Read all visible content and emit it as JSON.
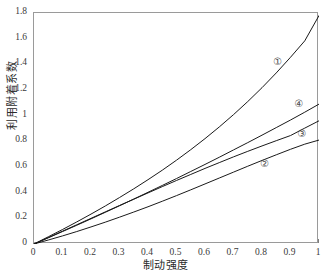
{
  "chart_data": {
    "type": "line",
    "title": "",
    "xlabel": "制动强度",
    "ylabel": "利用附着系数",
    "xlim": [
      0,
      1
    ],
    "ylim": [
      0,
      1.8
    ],
    "grid": false,
    "legend_position": "inline-annotations",
    "xticks": [
      "0",
      "0.1",
      "0.2",
      "0.3",
      "0.4",
      "0.5",
      "0.6",
      "0.7",
      "0.8",
      "0.9",
      "1"
    ],
    "xtick_values": [
      0,
      0.1,
      0.2,
      0.3,
      0.4,
      0.5,
      0.6,
      0.7,
      0.8,
      0.9,
      1
    ],
    "yticks": [
      "0",
      "0.2",
      "0.4",
      "0.6",
      "0.8",
      "1",
      "1.2",
      "1.4",
      "1.6",
      "1.8"
    ],
    "ytick_values": [
      0,
      0.2,
      0.4,
      0.6,
      0.8,
      1.0,
      1.2,
      1.4,
      1.6,
      1.8
    ],
    "x": [
      0,
      0.05,
      0.1,
      0.15,
      0.2,
      0.25,
      0.3,
      0.35,
      0.4,
      0.45,
      0.5,
      0.55,
      0.6,
      0.65,
      0.7,
      0.75,
      0.8,
      0.85,
      0.9,
      0.95,
      1.0
    ],
    "series": [
      {
        "name": "①",
        "color": "#1a1a1a",
        "values": [
          0,
          0.056,
          0.113,
          0.172,
          0.233,
          0.296,
          0.362,
          0.43,
          0.501,
          0.575,
          0.653,
          0.735,
          0.821,
          0.912,
          1.008,
          1.11,
          1.218,
          1.333,
          1.455,
          1.583,
          1.78
        ]
      },
      {
        "name": "②",
        "color": "#1a1a1a",
        "values": [
          0,
          0.031,
          0.063,
          0.097,
          0.133,
          0.17,
          0.209,
          0.249,
          0.29,
          0.333,
          0.377,
          0.422,
          0.468,
          0.514,
          0.56,
          0.606,
          0.651,
          0.695,
          0.738,
          0.778,
          0.81
        ]
      },
      {
        "name": "③",
        "color": "#1a1a1a",
        "values": [
          0,
          0.05,
          0.1,
          0.15,
          0.2,
          0.25,
          0.3,
          0.349,
          0.398,
          0.447,
          0.495,
          0.542,
          0.589,
          0.634,
          0.679,
          0.722,
          0.764,
          0.805,
          0.845,
          0.903,
          0.96
        ]
      },
      {
        "name": "④",
        "color": "#1a1a1a",
        "values": [
          0,
          0.048,
          0.097,
          0.146,
          0.196,
          0.247,
          0.298,
          0.35,
          0.403,
          0.456,
          0.51,
          0.565,
          0.62,
          0.676,
          0.733,
          0.79,
          0.848,
          0.907,
          0.966,
          1.027,
          1.09
        ]
      }
    ],
    "annotations": [
      {
        "name": "curve-label-1",
        "text": "①",
        "x": 0.855,
        "y": 1.415
      },
      {
        "name": "curve-label-4",
        "text": "④",
        "x": 0.93,
        "y": 1.09
      },
      {
        "name": "curve-label-3",
        "text": "③",
        "x": 0.94,
        "y": 0.86
      },
      {
        "name": "curve-label-2",
        "text": "②",
        "x": 0.81,
        "y": 0.62
      }
    ]
  },
  "style": {
    "axis_color": "#9a9a9a",
    "curve_color": "#1a1a1a",
    "tick_color": "#7d7d7d",
    "text_color": "#2b2b2b",
    "background": "#ffffff"
  }
}
